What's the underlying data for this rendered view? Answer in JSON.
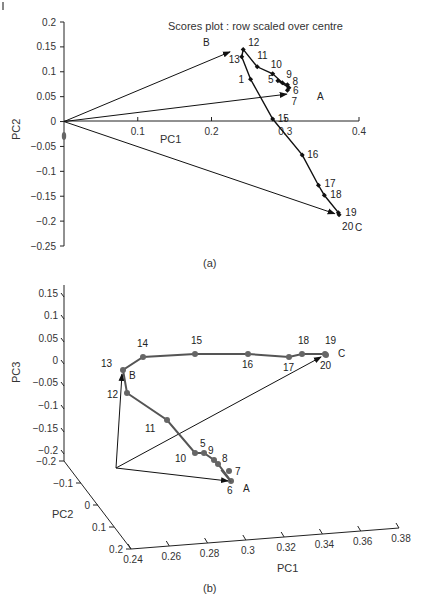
{
  "chart_data": [
    {
      "id": "a",
      "type": "line",
      "caption": "(a)",
      "title": "Scores plot : row scaled over centre",
      "xlabel": "PC1",
      "ylabel": "PC2",
      "xlim": [
        0,
        0.4
      ],
      "ylim": [
        -0.25,
        0.2
      ],
      "x_ticks": [
        "0.1",
        "0.2",
        "0.3",
        "0.4"
      ],
      "y_ticks": [
        "0.2",
        "0.15",
        "0.1",
        "0.05",
        "0",
        "-0.05",
        "-0.1",
        "-0.15",
        "-0.2",
        "-0.25"
      ],
      "grid": false,
      "vectors": [
        {
          "label": "A",
          "from": [
            0,
            0
          ],
          "to": [
            0.302,
            0.055
          ]
        },
        {
          "label": "B",
          "from": [
            0,
            0
          ],
          "to": [
            0.225,
            0.14
          ]
        },
        {
          "label": "C",
          "from": [
            0,
            0
          ],
          "to": [
            0.367,
            -0.185
          ]
        }
      ],
      "series": [
        {
          "name": "samples",
          "points": [
            {
              "label": "1",
              "x": 0.253,
              "y": 0.085
            },
            {
              "label": "5",
              "x": 0.29,
              "y": 0.082
            },
            {
              "label": "6",
              "x": 0.305,
              "y": 0.068
            },
            {
              "label": "7",
              "x": 0.303,
              "y": 0.063
            },
            {
              "label": "8",
              "x": 0.303,
              "y": 0.074
            },
            {
              "label": "9",
              "x": 0.296,
              "y": 0.078
            },
            {
              "label": "10",
              "x": 0.283,
              "y": 0.096
            },
            {
              "label": "11",
              "x": 0.262,
              "y": 0.11
            },
            {
              "label": "12",
              "x": 0.243,
              "y": 0.145
            },
            {
              "label": "13",
              "x": 0.241,
              "y": 0.13
            },
            {
              "label": "15",
              "x": 0.283,
              "y": 0.005
            },
            {
              "label": "16",
              "x": 0.323,
              "y": -0.067
            },
            {
              "label": "17",
              "x": 0.345,
              "y": -0.128
            },
            {
              "label": "18",
              "x": 0.353,
              "y": -0.148
            },
            {
              "label": "19",
              "x": 0.372,
              "y": -0.183
            },
            {
              "label": "20",
              "x": 0.373,
              "y": -0.187
            }
          ]
        }
      ]
    },
    {
      "id": "b",
      "type": "line",
      "subtype": "3d",
      "caption": "(b)",
      "xlabel": "PC1",
      "ylabel": "PC2",
      "zlabel": "PC3",
      "xlim": [
        0.24,
        0.38
      ],
      "ylim": [
        -0.2,
        0.2
      ],
      "zlim": [
        -0.2,
        0.15
      ],
      "x_ticks": [
        "0.24",
        "0.26",
        "0.28",
        "0.3",
        "0.32",
        "0.34",
        "0.36",
        "0.38"
      ],
      "y_ticks": [
        "-0.2",
        "-0.1",
        "0",
        "0.1",
        "0.2"
      ],
      "z_ticks": [
        "0.15",
        "0.1",
        "0.05",
        "0",
        "-0.05",
        "-0.1",
        "-0.15",
        "-0.2"
      ],
      "grid": false,
      "vectors": [
        {
          "label": "A"
        },
        {
          "label": "B"
        },
        {
          "label": "C"
        }
      ],
      "series": [
        {
          "name": "trajectory",
          "order": [
            "6",
            "7",
            "8",
            "9",
            "5",
            "10",
            "11",
            "12",
            "13",
            "14",
            "15",
            "16",
            "17",
            "18",
            "19",
            "20"
          ],
          "points": [
            "5",
            "6",
            "7",
            "8",
            "9",
            "10",
            "11",
            "12",
            "13",
            "14",
            "15",
            "16",
            "17",
            "18",
            "19",
            "20"
          ]
        }
      ]
    }
  ],
  "labels": {
    "page_corner": "I",
    "title_a": "Scores plot : row scaled over centre",
    "caption_a": "(a)",
    "caption_b": "(b)",
    "xlabel_a": "PC1",
    "ylabel_a": "PC2",
    "xlabel_b": "PC1",
    "ylabel_b": "PC2",
    "zlabel_b": "PC3"
  }
}
